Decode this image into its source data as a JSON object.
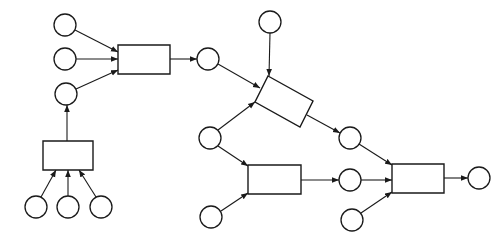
{
  "diagram": {
    "type": "network-flow",
    "colors": {
      "stroke": "#1a1a1a",
      "background": "#ffffff"
    },
    "places": [
      {
        "id": "p1",
        "cx": 65,
        "cy": 25,
        "r": 11
      },
      {
        "id": "p2",
        "cx": 65,
        "cy": 59,
        "r": 11
      },
      {
        "id": "p3",
        "cx": 66,
        "cy": 94,
        "r": 11
      },
      {
        "id": "p4",
        "cx": 36,
        "cy": 207,
        "r": 11
      },
      {
        "id": "p5",
        "cx": 68,
        "cy": 207,
        "r": 11
      },
      {
        "id": "p6",
        "cx": 101,
        "cy": 207,
        "r": 11
      },
      {
        "id": "p7",
        "cx": 208,
        "cy": 59,
        "r": 11
      },
      {
        "id": "p8",
        "cx": 270,
        "cy": 22,
        "r": 11
      },
      {
        "id": "p9",
        "cx": 210,
        "cy": 138,
        "r": 11
      },
      {
        "id": "p10",
        "cx": 350,
        "cy": 138,
        "r": 11
      },
      {
        "id": "p11",
        "cx": 211,
        "cy": 217,
        "r": 11
      },
      {
        "id": "p12",
        "cx": 350,
        "cy": 180,
        "r": 11
      },
      {
        "id": "p13",
        "cx": 352,
        "cy": 220,
        "r": 11
      },
      {
        "id": "p14",
        "cx": 479,
        "cy": 178,
        "r": 11
      }
    ],
    "transitions": [
      {
        "id": "t1",
        "points": "118,45 170,45 170,74 118,74"
      },
      {
        "id": "t2",
        "points": "43,141 93,141 93,170 43,170"
      },
      {
        "id": "t3",
        "points": "268,76 313,101 300,127 255,102"
      },
      {
        "id": "t4",
        "points": "248,165 301,165 301,194 248,194"
      },
      {
        "id": "t5",
        "points": "392,164 444,164 444,193 392,193"
      }
    ],
    "arcs": [
      {
        "from": "p1",
        "to": "t1",
        "x1": 75,
        "y1": 30,
        "x2": 118,
        "y2": 52
      },
      {
        "from": "p2",
        "to": "t1",
        "x1": 76,
        "y1": 59,
        "x2": 118,
        "y2": 59
      },
      {
        "from": "p3",
        "to": "t1",
        "x1": 76,
        "y1": 89,
        "x2": 118,
        "y2": 70
      },
      {
        "from": "t2",
        "to": "p3",
        "x1": 67,
        "y1": 141,
        "x2": 67,
        "y2": 105
      },
      {
        "from": "p4",
        "to": "t2",
        "x1": 41,
        "y1": 197,
        "x2": 56,
        "y2": 170
      },
      {
        "from": "p5",
        "to": "t2",
        "x1": 68,
        "y1": 196,
        "x2": 68,
        "y2": 170
      },
      {
        "from": "p6",
        "to": "t2",
        "x1": 96,
        "y1": 197,
        "x2": 79,
        "y2": 170
      },
      {
        "from": "t1",
        "to": "p7",
        "x1": 170,
        "y1": 59,
        "x2": 197,
        "y2": 59
      },
      {
        "from": "p7",
        "to": "t3",
        "x1": 218,
        "y1": 64,
        "x2": 260,
        "y2": 88
      },
      {
        "from": "p8",
        "to": "t3",
        "x1": 270,
        "y1": 33,
        "x2": 269,
        "y2": 76
      },
      {
        "from": "p9",
        "to": "t3",
        "x1": 218,
        "y1": 130,
        "x2": 255,
        "y2": 102
      },
      {
        "from": "t3",
        "to": "p10",
        "x1": 307,
        "y1": 115,
        "x2": 340,
        "y2": 133
      },
      {
        "from": "p9",
        "to": "t4",
        "x1": 218,
        "y1": 146,
        "x2": 248,
        "y2": 166
      },
      {
        "from": "p11",
        "to": "t4",
        "x1": 221,
        "y1": 211,
        "x2": 248,
        "y2": 193
      },
      {
        "from": "t4",
        "to": "p12",
        "x1": 301,
        "y1": 180,
        "x2": 339,
        "y2": 180
      },
      {
        "from": "p10",
        "to": "t5",
        "x1": 359,
        "y1": 144,
        "x2": 392,
        "y2": 165
      },
      {
        "from": "p12",
        "to": "t5",
        "x1": 361,
        "y1": 180,
        "x2": 392,
        "y2": 180
      },
      {
        "from": "p13",
        "to": "t5",
        "x1": 361,
        "y1": 213,
        "x2": 392,
        "y2": 192
      },
      {
        "from": "t5",
        "to": "p14",
        "x1": 444,
        "y1": 178,
        "x2": 468,
        "y2": 178
      }
    ]
  }
}
